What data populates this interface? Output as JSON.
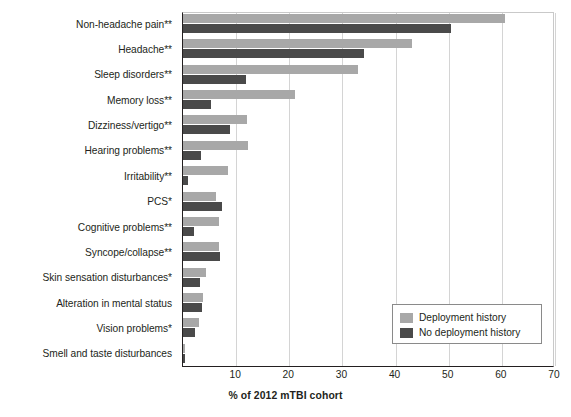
{
  "chart_data": {
    "type": "bar",
    "orientation": "horizontal",
    "title": "",
    "xlabel": "% of 2012 mTBI cohort",
    "ylabel": "",
    "xlim": [
      0,
      70
    ],
    "xticks": [
      0,
      10,
      20,
      30,
      40,
      50,
      60,
      70
    ],
    "xtick_labels": [
      "0",
      "10",
      "20",
      "30",
      "40",
      "50",
      "60",
      "70"
    ],
    "grid": "vertical",
    "legend_position": "lower-right-inside",
    "categories": [
      "Non-headache pain**",
      "Headache**",
      "Sleep disorders**",
      "Memory loss**",
      "Dizziness/vertigo**",
      "Hearing problems**",
      "Irritability**",
      "PCS*",
      "Cognitive problems**",
      "Syncope/collapse**",
      "Skin sensation disturbances*",
      "Alteration in mental status",
      "Vision problems*",
      "Smell and taste disturbances"
    ],
    "series": [
      {
        "name": "Deployment history",
        "color": "#a8a8a8",
        "values": [
          60.5,
          43.0,
          33.0,
          21.0,
          12.0,
          12.2,
          8.5,
          6.2,
          6.8,
          6.7,
          4.4,
          3.8,
          3.0,
          0.4
        ]
      },
      {
        "name": "No deployment history",
        "color": "#4a4a4a",
        "values": [
          50.5,
          34.0,
          11.8,
          5.2,
          8.8,
          3.3,
          0.9,
          7.3,
          2.0,
          6.9,
          3.2,
          3.6,
          2.2,
          0.3
        ]
      }
    ]
  },
  "legend": {
    "items": [
      {
        "label": "Deployment history",
        "swatch": "dep"
      },
      {
        "label": "No deployment history",
        "swatch": "nodep"
      }
    ]
  }
}
